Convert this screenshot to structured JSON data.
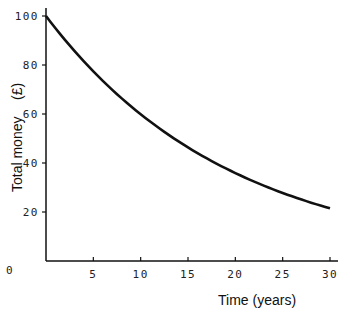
{
  "chart_data": {
    "type": "line",
    "title": "",
    "xlabel": "Time (years)",
    "ylabel": "Total money",
    "ylabel_unit": "(£)",
    "xlim": [
      0,
      30
    ],
    "ylim": [
      0,
      100
    ],
    "x_ticks": [
      "0",
      "5",
      "10",
      "15",
      "20",
      "25",
      "30"
    ],
    "y_ticks": [
      "20",
      "40",
      "60",
      "80",
      "100"
    ],
    "grid": false,
    "legend": null,
    "series": [
      {
        "name": "Total money",
        "x": [
          0,
          5,
          10,
          15,
          20,
          25,
          30
        ],
        "values": [
          100,
          77.4,
          59.9,
          46.3,
          35.8,
          27.7,
          21.5
        ],
        "color": "#111111"
      }
    ]
  }
}
